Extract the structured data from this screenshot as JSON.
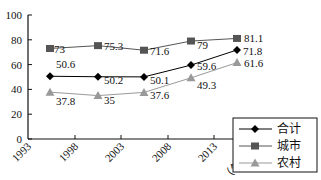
{
  "chart_data": {
    "type": "line",
    "title": "",
    "xlabel": "（年份）",
    "ylabel": "",
    "ylim": [
      0,
      100
    ],
    "yticks": [
      "0",
      "20",
      "40",
      "60",
      "80",
      "100"
    ],
    "xticks": [
      "1993",
      "1998",
      "2003",
      "2008",
      "2013"
    ],
    "x": [
      "1995",
      "2000",
      "2005",
      "2010",
      "2015"
    ],
    "series": [
      {
        "name": "合计",
        "marker": "diamond",
        "color": "#000000",
        "values": [
          50.6,
          50.2,
          50.1,
          59.6,
          71.8
        ],
        "labels": [
          "50.6",
          "50.2",
          "50.1",
          "59.6",
          "71.8"
        ]
      },
      {
        "name": "城市",
        "marker": "square",
        "color": "#555555",
        "values": [
          73,
          75.3,
          71.6,
          79,
          81.1
        ],
        "labels": [
          "73",
          "75.3",
          "71.6",
          "79",
          "81.1"
        ]
      },
      {
        "name": "农村",
        "marker": "triangle",
        "color": "#999999",
        "values": [
          37.8,
          35,
          37.6,
          49.3,
          61.6
        ],
        "labels": [
          "37.8",
          "35",
          "37.6",
          "49.3",
          "61.6"
        ]
      }
    ],
    "grid": false,
    "legend_position": "lower right"
  }
}
